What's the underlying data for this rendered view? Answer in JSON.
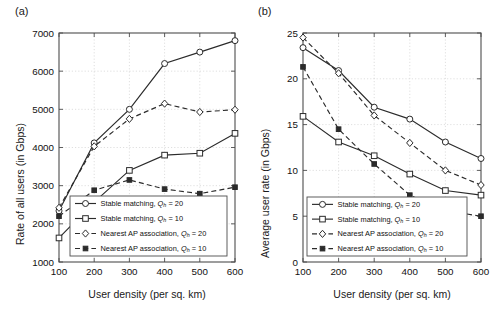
{
  "figure": {
    "panels": [
      {
        "tag": "(a)",
        "xlabel": "User density (per sq. km)",
        "ylabel": "Rate of all users (in Gbps)"
      },
      {
        "tag": "(b)",
        "xlabel": "User density (per sq. km)",
        "ylabel": "Average user rate (in Gbps)"
      }
    ],
    "legend": {
      "entries": [
        {
          "label": "Stable matching, ",
          "symbol": "Q",
          "sub": "h",
          "eq": " = 20",
          "marker": "circle-open",
          "line": "solid"
        },
        {
          "label": "Stable matching, ",
          "symbol": "Q",
          "sub": "h",
          "eq": " = 10",
          "marker": "square-open",
          "line": "solid"
        },
        {
          "label": "Nearest AP association, ",
          "symbol": "Q",
          "sub": "h",
          "eq": " = 20",
          "marker": "diamond-open",
          "line": "dashed"
        },
        {
          "label": "Nearest AP association, ",
          "symbol": "Q",
          "sub": "h",
          "eq": " = 10",
          "marker": "square-filled",
          "line": "dashed"
        }
      ]
    }
  },
  "chart_data": [
    {
      "type": "line",
      "panel": "(a)",
      "title": "",
      "xlabel": "User density (per sq. km)",
      "ylabel": "Rate of all users (in Gbps)",
      "x": [
        100,
        200,
        300,
        400,
        500,
        600
      ],
      "xlim": [
        100,
        600
      ],
      "ylim": [
        1000,
        7000
      ],
      "xticks": [
        100,
        200,
        300,
        400,
        500,
        600
      ],
      "yticks": [
        1000,
        2000,
        3000,
        4000,
        5000,
        6000,
        7000
      ],
      "grid": true,
      "legend_position": "lower-center",
      "series": [
        {
          "name": "Stable matching, Qh = 20",
          "marker": "circle-open",
          "line": "solid",
          "values": [
            2340,
            4120,
            5000,
            6200,
            6500,
            6800
          ]
        },
        {
          "name": "Stable matching, Qh = 10",
          "marker": "square-open",
          "line": "solid",
          "values": [
            1630,
            2570,
            3400,
            3800,
            3850,
            4370
          ]
        },
        {
          "name": "Nearest AP association, Qh = 20",
          "marker": "diamond-open",
          "line": "dashed",
          "values": [
            2420,
            4030,
            4750,
            5150,
            4930,
            4990
          ]
        },
        {
          "name": "Nearest AP association, Qh = 10",
          "marker": "square-filled",
          "line": "dashed",
          "values": [
            2200,
            2880,
            3150,
            2910,
            2790,
            2960
          ]
        }
      ]
    },
    {
      "type": "line",
      "panel": "(b)",
      "title": "",
      "xlabel": "User density (per sq. km)",
      "ylabel": "Average user rate (in Gbps)",
      "x": [
        100,
        200,
        300,
        400,
        500,
        600
      ],
      "xlim": [
        100,
        600
      ],
      "ylim": [
        0,
        25
      ],
      "xticks": [
        100,
        200,
        300,
        400,
        500,
        600
      ],
      "yticks": [
        0,
        5,
        10,
        15,
        20,
        25
      ],
      "grid": true,
      "legend_position": "lower-left",
      "series": [
        {
          "name": "Stable matching, Qh = 20",
          "marker": "circle-open",
          "line": "solid",
          "values": [
            23.4,
            20.9,
            16.9,
            15.6,
            13.1,
            11.3
          ]
        },
        {
          "name": "Stable matching, Qh = 10",
          "marker": "square-open",
          "line": "solid",
          "values": [
            15.9,
            13.1,
            11.6,
            9.6,
            7.8,
            7.3
          ]
        },
        {
          "name": "Nearest AP association, Qh = 20",
          "marker": "diamond-open",
          "line": "dashed",
          "values": [
            24.5,
            20.6,
            16.0,
            13.0,
            10.0,
            8.4
          ]
        },
        {
          "name": "Nearest AP association, Qh = 10",
          "marker": "square-filled",
          "line": "dashed",
          "values": [
            21.3,
            14.5,
            10.7,
            7.3,
            5.6,
            5.0
          ]
        }
      ]
    }
  ]
}
